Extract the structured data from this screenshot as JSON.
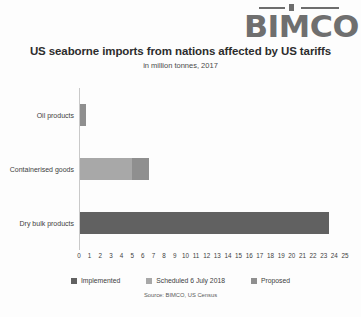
{
  "logo": {
    "name": "BIMCO",
    "text": "BIMCO"
  },
  "chart_data": {
    "type": "bar",
    "orientation": "horizontal",
    "stacked": true,
    "title": "US seaborne imports from nations affected by US tariffs",
    "subtitle": "in million tonnes, 2017",
    "xlabel": "",
    "ylabel": "",
    "xlim": [
      0,
      25
    ],
    "xticks": [
      0,
      1,
      2,
      3,
      4,
      5,
      6,
      7,
      8,
      9,
      10,
      11,
      12,
      13,
      14,
      15,
      16,
      17,
      18,
      19,
      20,
      21,
      22,
      23,
      24,
      25
    ],
    "grid": false,
    "legend_position": "bottom",
    "categories": [
      "Oil products",
      "Containerised goods",
      "Dry bulk products"
    ],
    "series": [
      {
        "name": "Implemented",
        "color": "#616161",
        "values": [
          0,
          0,
          23.4
        ]
      },
      {
        "name": "Scheduled 6 July 2018",
        "color": "#a8a8a8",
        "values": [
          0,
          4.9,
          0
        ]
      },
      {
        "name": "Proposed",
        "color": "#8f8f8f",
        "values": [
          0.55,
          1.6,
          0
        ]
      }
    ],
    "source": "Source: BIMCO, US Census"
  },
  "legend": {
    "items": [
      {
        "label": "Implemented",
        "color": "#616161"
      },
      {
        "label": "Scheduled 6 July 2018",
        "color": "#a8a8a8"
      },
      {
        "label": "Proposed",
        "color": "#8f8f8f"
      }
    ]
  }
}
